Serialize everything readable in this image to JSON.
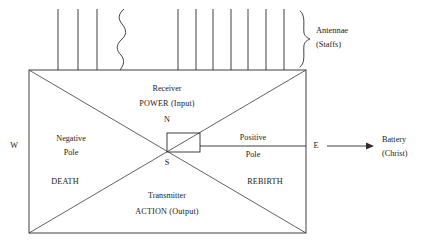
{
  "diagram": {
    "title_present": false,
    "colors": {
      "stroke": "#2b2b2b",
      "text": "#1a1a1a",
      "background": "#ffffff"
    },
    "antennae": {
      "label_line1": "Antennae",
      "label_line2": "(Staffs)",
      "straight_count_left": 3,
      "wavy_count": 1,
      "straight_count_right": 7
    },
    "box": {
      "top_section": {
        "line1": "Receiver",
        "line2": "POWER (Input)"
      },
      "bottom_section": {
        "line1": "Transmitter",
        "line2": "ACTION (Output)"
      },
      "left_section": {
        "line1": "Negative",
        "line2": "Pole",
        "keyword": "DEATH"
      },
      "right_section": {
        "line1": "Positive",
        "line2": "Pole",
        "keyword": "REBIRTH"
      },
      "center_north": "N",
      "center_south": "S"
    },
    "compass": {
      "west": "W",
      "east": "E"
    },
    "battery": {
      "line1": "Battery",
      "line2": "(Christ)"
    }
  }
}
